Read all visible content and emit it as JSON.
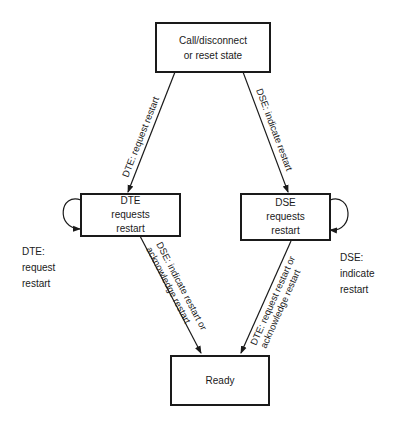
{
  "diagram": {
    "type": "state-diagram",
    "states": [
      {
        "id": "call",
        "lines": [
          "Call/disconnect",
          "or reset state"
        ]
      },
      {
        "id": "dte",
        "lines": [
          "DTE",
          "requests",
          "restart"
        ]
      },
      {
        "id": "dse",
        "lines": [
          "DSE",
          "requests",
          "restart"
        ]
      },
      {
        "id": "ready",
        "lines": [
          "Ready"
        ]
      }
    ],
    "transitions": [
      {
        "from": "call",
        "to": "dte",
        "label": "DTE: request restart"
      },
      {
        "from": "call",
        "to": "dse",
        "label": "DSE: indicate restart"
      },
      {
        "from": "dte",
        "to": "ready",
        "label_line1": "DSE: indicate restart or",
        "label_line2": "acknowledge restart"
      },
      {
        "from": "dse",
        "to": "ready",
        "label_line1": "DTE: request restart or",
        "label_line2": "acknowledge restart"
      }
    ],
    "self_loops": {
      "dte": {
        "lines": [
          "DTE:",
          "request",
          "restart"
        ]
      },
      "dse": {
        "lines": [
          "DSE:",
          "indicate",
          "restart"
        ]
      }
    }
  }
}
